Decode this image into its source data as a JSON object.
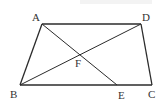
{
  "figure": {
    "type": "trapezoid-with-diagonals",
    "points": {
      "A": {
        "x": 42,
        "y": 24,
        "label": "A",
        "lx": 32,
        "ly": 21
      },
      "D": {
        "x": 141,
        "y": 24,
        "label": "D",
        "lx": 142,
        "ly": 21
      },
      "B": {
        "x": 20,
        "y": 85,
        "label": "B",
        "lx": 10,
        "ly": 98
      },
      "C": {
        "x": 152,
        "y": 85,
        "label": "C",
        "lx": 148,
        "ly": 98
      },
      "E": {
        "x": 117,
        "y": 85,
        "label": "E",
        "lx": 118,
        "ly": 99
      },
      "F": {
        "x": 80,
        "y": 54,
        "label": "F",
        "lx": 75,
        "ly": 67
      }
    },
    "segments": [
      [
        "A",
        "D"
      ],
      [
        "D",
        "C"
      ],
      [
        "C",
        "B"
      ],
      [
        "B",
        "A"
      ],
      [
        "A",
        "E"
      ],
      [
        "B",
        "D"
      ]
    ],
    "colors": {
      "stroke": "#2b2b2b",
      "label": "#333333",
      "background": "#ffffff"
    }
  }
}
